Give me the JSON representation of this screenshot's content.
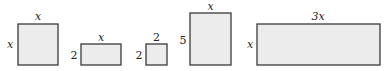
{
  "diagram": {
    "type": "algebra-tiles",
    "tiles": [
      {
        "name": "x-squared-tile",
        "width_label": "x",
        "height_label": "x",
        "x": 18,
        "y": 24,
        "w": 40,
        "h": 41
      },
      {
        "name": "x-by-2-tile",
        "width_label": "x",
        "height_label": "2",
        "x": 81,
        "y": 44,
        "w": 40,
        "h": 21
      },
      {
        "name": "2-by-2-tile",
        "width_label": "2",
        "height_label": "2",
        "x": 146,
        "y": 44,
        "w": 21,
        "h": 21
      },
      {
        "name": "x-by-5-tile",
        "width_label": "x",
        "height_label": "5",
        "x": 190,
        "y": 13,
        "w": 41,
        "h": 52
      },
      {
        "name": "3x-by-x-tile",
        "width_label": "3x",
        "height_label": "x",
        "x": 257,
        "y": 24,
        "w": 123,
        "h": 41
      }
    ],
    "colors": {
      "fill": "#ececec",
      "stroke": "#3a3a3a",
      "text": "#222222"
    }
  }
}
